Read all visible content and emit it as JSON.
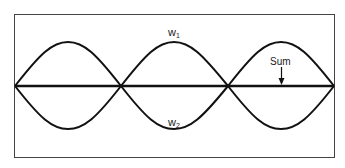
{
  "diagram": {
    "type": "wave-superposition",
    "labels": {
      "wave1": "w",
      "wave1_sub": "1",
      "wave2": "w",
      "wave2_sub": "2",
      "sum": "Sum"
    },
    "waves": [
      {
        "name": "w1",
        "phase": "positive",
        "half_cycles": 3
      },
      {
        "name": "w2",
        "phase": "inverted",
        "half_cycles": 3
      },
      {
        "name": "Sum",
        "shape": "flat line"
      }
    ],
    "colors": {
      "line": "#111111",
      "frame": "#444444",
      "background": "#ffffff"
    }
  }
}
